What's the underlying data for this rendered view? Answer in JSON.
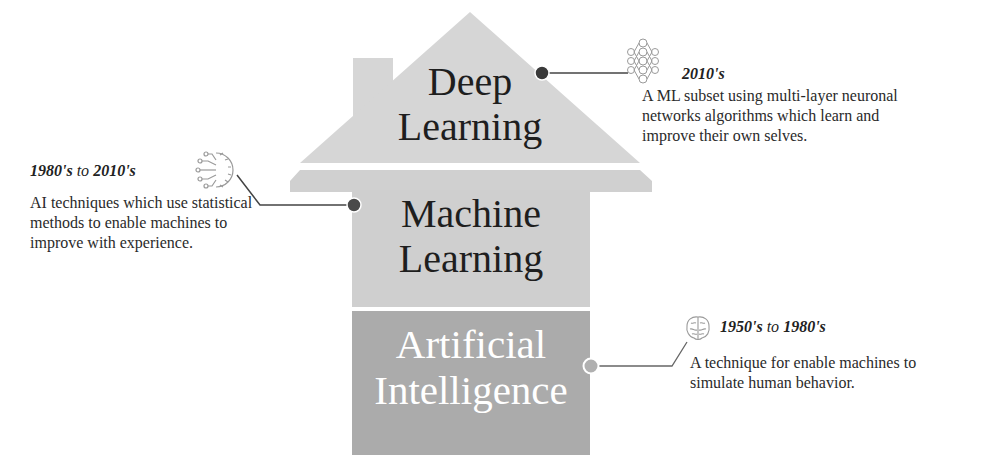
{
  "diagram": {
    "layers": [
      {
        "id": "deep-learning",
        "title_line1": "Deep",
        "title_line2": "Learning",
        "era": "2010's",
        "description": "A ML subset using multi-layer neuronal networks algorithms which learn and improve their own selves.",
        "icon": "neural-network-icon",
        "color": "#d4d4d4"
      },
      {
        "id": "machine-learning",
        "title_line1": "Machine",
        "title_line2": "Learning",
        "era_from": "1980's",
        "era_to_word": "to",
        "era_to": "2010's",
        "description": "AI techniques which use statistical methods to enable machines to improve with experience.",
        "icon": "circuit-gear-icon",
        "color": "#cfcfcf"
      },
      {
        "id": "artificial-intelligence",
        "title_line1": "Artificial",
        "title_line2": "Intelligence",
        "era_from": "1950's",
        "era_to_word": "to",
        "era_to": "1980's",
        "description": "A technique for enable machines to simulate human behavior.",
        "icon": "brain-icon",
        "color": "#a9a9a9"
      }
    ],
    "colors": {
      "roof": "#d6d6d6",
      "machine_learning_body": "#cfcfcf",
      "ai_body": "#ababab",
      "connector_line": "#555555",
      "dot_dark": "#3a3a3a",
      "dot_light": "#a8a8a8"
    }
  }
}
